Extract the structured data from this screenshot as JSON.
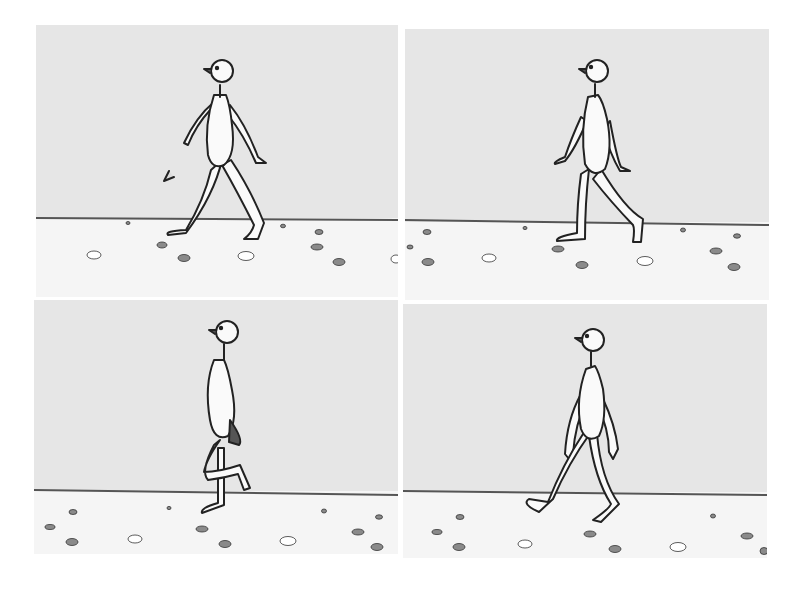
{
  "figure": {
    "type": "four-panel cartoon walk cycle",
    "colors": {
      "sky": "#e6e6e6",
      "ground": "#f5f5f5",
      "horizon": "#555555",
      "ink": "#222222",
      "body": "#fafafa",
      "pebble_dark": "#8a8a8a",
      "pebble_light": "#ffffff"
    },
    "panels": [
      {
        "id": "panel-1",
        "pose": "contact-stride",
        "x": 36,
        "y": 25,
        "w": 362,
        "h": 272,
        "horizon_y": 193
      },
      {
        "id": "panel-2",
        "pose": "push-off",
        "x": 405,
        "y": 29,
        "w": 364,
        "h": 271,
        "horizon_y": 193
      },
      {
        "id": "panel-3",
        "pose": "passing-leg-raised",
        "x": 34,
        "y": 300,
        "w": 364,
        "h": 254,
        "horizon_y": 191
      },
      {
        "id": "panel-4",
        "pose": "heel-strike",
        "x": 403,
        "y": 304,
        "w": 364,
        "h": 254,
        "horizon_y": 188
      }
    ]
  }
}
